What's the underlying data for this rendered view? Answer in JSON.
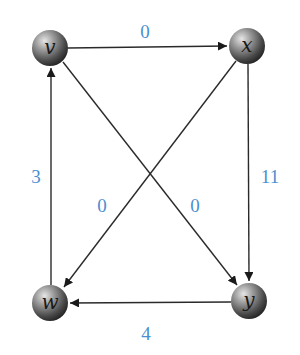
{
  "graph": {
    "type": "directed-weighted-graph",
    "nodes": [
      {
        "id": "v",
        "label": "v",
        "x": 50,
        "y": 48
      },
      {
        "id": "x",
        "label": "x",
        "x": 247,
        "y": 46
      },
      {
        "id": "w",
        "label": "w",
        "x": 50,
        "y": 303
      },
      {
        "id": "y",
        "label": "y",
        "x": 249,
        "y": 301
      }
    ],
    "edges": [
      {
        "from": "v",
        "to": "x",
        "weight": "0"
      },
      {
        "from": "x",
        "to": "y",
        "weight": "11"
      },
      {
        "from": "y",
        "to": "w",
        "weight": "4"
      },
      {
        "from": "w",
        "to": "v",
        "weight": "3"
      },
      {
        "from": "x",
        "to": "w",
        "weight": "0"
      },
      {
        "from": "v",
        "to": "y",
        "weight": "0"
      }
    ]
  },
  "colors": {
    "edge": "#222222",
    "weight_label": "#4a8fd0",
    "node_light": "#d8d8d8",
    "node_dark": "#2a2a2a"
  }
}
